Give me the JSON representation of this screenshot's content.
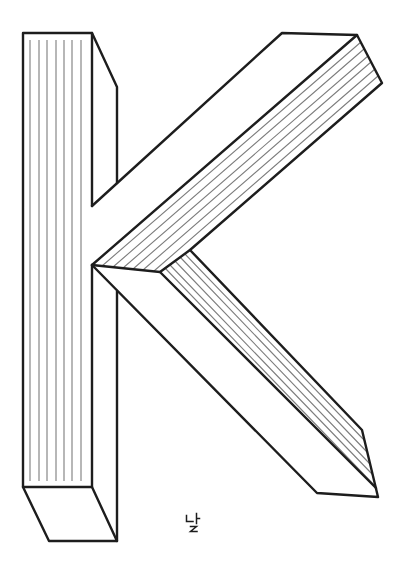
{
  "figure": {
    "background_color": "#ffffff",
    "outline_color": "#1d1d1d",
    "hatch_color": "#7d7d7d",
    "viewbox": "0 0 412 575",
    "geometry": {
      "stem_front_face": "M92 265 L92 487 L23 487 L23 33 L92 33 L92 206",
      "stem_side_top": "M92 33 L117 87 L117 183",
      "stem_bottom_face": "M23 487 L49 541 L117 541 L92 487",
      "stem_side_right_lower": "M117 291 L117 541",
      "upper_arm_outline": "M92 206 L282 33 L357 35 L382 83 L190 250 L160 272 L92 265",
      "upper_arm_ridge": "M357 35 L92 265",
      "lower_arm_outline": "M190 250 L362 430 L378 497 L317 493 L92 265",
      "lower_arm_ridge": "M160 272 L376 488",
      "stem_hatch": "M30 40V481M39 40V481M47 40V481M56 40V481M64 40V481M72 40V481M81 40V481",
      "upper_arm_hatch": "M361 42L102 266M364 49L113 267M368 56L123 268M371 62L133 269M375 69L143 270M378 76L154 271",
      "lower_arm_hatch": "M185 254L365 441M180 257L367 452M175 261L370 464M170 265L373 475M165 268L375 486"
    }
  },
  "footer_mark": {
    "text": "나 2",
    "glyph_nieun": "M186.5 515.5 L186.5 521.5 L193 521.5",
    "glyph_a": "M196.5 513.5 L196.5 523.5 M196.5 518.5 L199.5 518.5",
    "glyph_two": "M190.5 526.5 L196.5 526.5 L190.5 531.5 L197 531.5"
  }
}
